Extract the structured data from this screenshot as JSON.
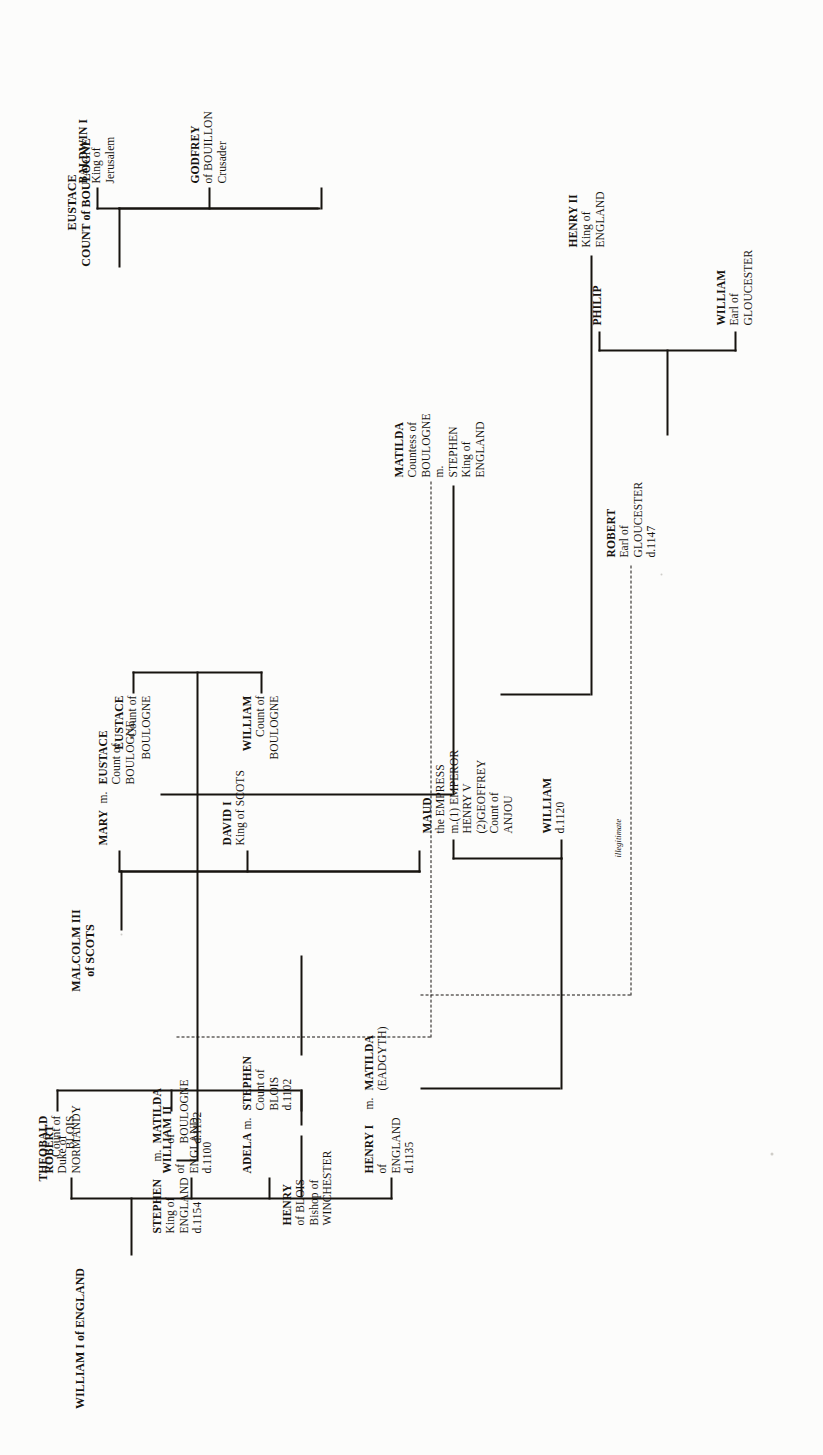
{
  "document": {
    "kind": "genealogical-chart",
    "orientation": "rotated-90-ccw",
    "background_color": "#fcfcfb",
    "ink_color": "#16130f"
  },
  "titles": {
    "boulogne": "EUSTACE\nCOUNT of BOULOGNE",
    "boulogne_line1": "EUSTACE",
    "boulogne_line2": "COUNT of BOULOGNE",
    "scots_line1": "MALCOLM III",
    "scots_line2": "of SCOTS",
    "england_line1": "WILLIAM I of ENGLAND"
  },
  "annotations": {
    "illegitimate": "illegitimate"
  },
  "nodes": {
    "eustace_boulogne_title": {
      "name": "EUSTACE",
      "sub": "COUNT of BOULOGNE"
    },
    "baldwin_i": {
      "name": "BALDWIN I",
      "l2": "King of",
      "l3": "Jerusalem"
    },
    "godfrey": {
      "name": "GODFREY",
      "l2": "of BOUILLON",
      "l3": "Crusader"
    },
    "eustace_count": {
      "name": "EUSTACE",
      "l2": "Count of",
      "l3": "BOULOGNE"
    },
    "mary": {
      "name": "MARY",
      "marry": "m."
    },
    "malcolm_iii": {
      "name": "MALCOLM III",
      "sub": "of SCOTS"
    },
    "david_i": {
      "name": "DAVID I",
      "l2": "King of SCOTS"
    },
    "matilda_eadgyth": {
      "name": "MATILDA",
      "l2": "(EADGYTH)"
    },
    "henry_i": {
      "name": "HENRY I",
      "marry": "m.",
      "l2": "of",
      "l3": "ENGLAND",
      "l4": "d.1135"
    },
    "matilda_boulogne": {
      "name": "MATILDA",
      "l2": "Countess of",
      "l3": "BOULOGNE",
      "l4": "m.",
      "l5": "STEPHEN",
      "l6": "King of",
      "l7": "ENGLAND"
    },
    "maud_empress": {
      "name": "MAUD",
      "l2": "the EMPRESS",
      "l3": "m.(1) EMPEROR",
      "l4": "HENRY V",
      "l5": "(2)GEOFFREY",
      "l6": "Count of",
      "l7": "ANJOU"
    },
    "william_1120": {
      "name": "WILLIAM",
      "l2": "d.1120"
    },
    "henry_ii": {
      "name": "HENRY II",
      "l2": "King of",
      "l3": "ENGLAND"
    },
    "william_i_england": {
      "name": "WILLIAM I of ENGLAND"
    },
    "robert_normandy": {
      "name": "ROBERT",
      "l2": "Duke of",
      "l3": "NORMANDY"
    },
    "william_ii": {
      "name": "WILLIAM II",
      "l2": "of",
      "l3": "ENGLAND",
      "l4": "d.1100"
    },
    "adela": {
      "name": "ADELA",
      "marry": "m."
    },
    "stephen_blois": {
      "name": "STEPHEN",
      "l2": "Count of",
      "l3": "BLOIS",
      "l4": "d.1102"
    },
    "theobald": {
      "name": "THEOBALD",
      "l2": "Count of",
      "l3": "BLOIS"
    },
    "stephen_king": {
      "name": "STEPHEN",
      "marry": "m.",
      "l2": "King of",
      "l3": "ENGLAND",
      "l4": "d.1154"
    },
    "matilda_boulogne2": {
      "name": "MATILDA",
      "l2": "of",
      "l3": "BOULOGNE",
      "l4": "d.1152"
    },
    "henry_of_blois": {
      "name": "HENRY",
      "l2": "of BLOIS",
      "l3": "Bishop of",
      "l4": "WINCHESTER"
    },
    "robert_gloucester": {
      "name": "ROBERT",
      "l2": "Earl of",
      "l3": "GLOUCESTER",
      "l4": "d.1147"
    },
    "william_gloucester": {
      "name": "WILLIAM",
      "l2": "Earl of",
      "l3": "GLOUCESTER"
    },
    "philip": {
      "name": "PHILIP"
    },
    "eustace_boulogne_son": {
      "name": "EUSTACE",
      "l2": "Count of",
      "l3": "BOULOGNE"
    },
    "william_boulogne_son": {
      "name": "WILLIAM",
      "l2": "Count of",
      "l3": "BOULOGNE"
    }
  }
}
